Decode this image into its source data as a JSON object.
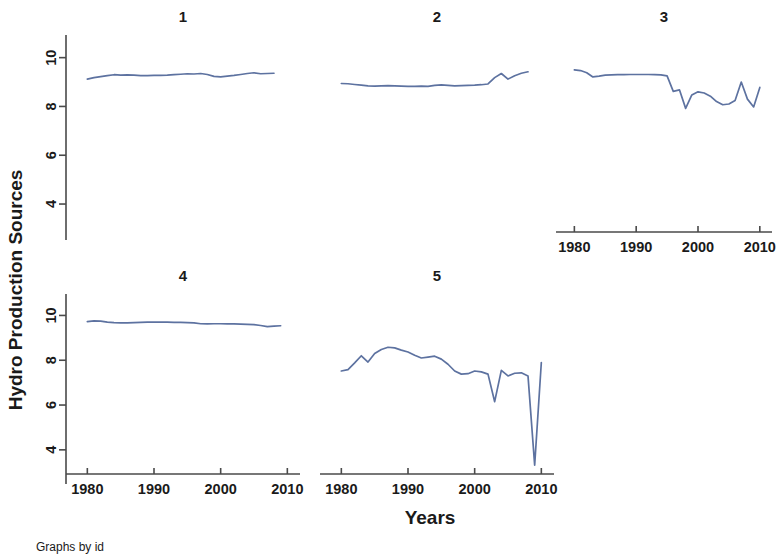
{
  "chart_data": {
    "type": "line",
    "title": "",
    "xlabel": "Years",
    "ylabel": "Hydro Production Sources",
    "note": "Graphs by id",
    "grid": false,
    "legend": "none",
    "line_color": "#5d72a0",
    "axis_color": "#4a4a4a",
    "xlim": [
      1978,
      2011
    ],
    "ylim": [
      3.1,
      10.6
    ],
    "yticks": [
      4,
      6,
      8,
      10
    ],
    "ytick_labels": [
      "4",
      "6",
      "8",
      "10"
    ],
    "xticks": [
      1980,
      1990,
      2000,
      2010
    ],
    "xtick_labels": [
      "1980",
      "1990",
      "2000",
      "2010"
    ],
    "layout": {
      "rows": 2,
      "cols": 3,
      "panel_var": "id"
    },
    "panels": [
      {
        "id": "1",
        "title": "1",
        "row": 0,
        "col": 0,
        "x_axis_visible": false,
        "y_axis_visible": true,
        "x": [
          1980,
          1981,
          1982,
          1983,
          1984,
          1985,
          1986,
          1987,
          1988,
          1989,
          1990,
          1991,
          1992,
          1993,
          1994,
          1995,
          1996,
          1997,
          1998,
          1999,
          2000,
          2001,
          2002,
          2003,
          2004,
          2005,
          2006,
          2007,
          2008
        ],
        "y": [
          9.12,
          9.18,
          9.22,
          9.26,
          9.3,
          9.28,
          9.29,
          9.28,
          9.26,
          9.26,
          9.27,
          9.27,
          9.28,
          9.3,
          9.32,
          9.34,
          9.33,
          9.35,
          9.31,
          9.23,
          9.21,
          9.24,
          9.27,
          9.31,
          9.35,
          9.38,
          9.34,
          9.35,
          9.36
        ]
      },
      {
        "id": "2",
        "title": "2",
        "row": 0,
        "col": 1,
        "x_axis_visible": false,
        "y_axis_visible": false,
        "x": [
          1980,
          1981,
          1982,
          1983,
          1984,
          1985,
          1986,
          1987,
          1988,
          1989,
          1990,
          1991,
          1992,
          1993,
          1994,
          1995,
          1996,
          1997,
          1998,
          1999,
          2000,
          2001,
          2002,
          2003,
          2004,
          2005,
          2006,
          2007,
          2008
        ],
        "y": [
          8.94,
          8.93,
          8.9,
          8.87,
          8.84,
          8.83,
          8.84,
          8.85,
          8.84,
          8.83,
          8.82,
          8.82,
          8.83,
          8.82,
          8.86,
          8.88,
          8.86,
          8.84,
          8.85,
          8.86,
          8.87,
          8.89,
          8.92,
          9.18,
          9.35,
          9.12,
          9.26,
          9.36,
          9.42
        ]
      },
      {
        "id": "3",
        "title": "3",
        "row": 0,
        "col": 2,
        "x_axis_visible": true,
        "y_axis_visible": false,
        "x": [
          1980,
          1981,
          1982,
          1983,
          1984,
          1985,
          1986,
          1987,
          1988,
          1989,
          1990,
          1991,
          1992,
          1993,
          1994,
          1995,
          1996,
          1997,
          1998,
          1999,
          2000,
          2001,
          2002,
          2003,
          2004,
          2005,
          2006,
          2007,
          2008,
          2009,
          2010
        ],
        "y": [
          9.5,
          9.47,
          9.38,
          9.21,
          9.24,
          9.28,
          9.29,
          9.3,
          9.3,
          9.31,
          9.31,
          9.31,
          9.31,
          9.3,
          9.29,
          9.25,
          8.62,
          8.68,
          7.92,
          8.47,
          8.6,
          8.55,
          8.42,
          8.2,
          8.07,
          8.1,
          8.24,
          9.0,
          8.3,
          7.98,
          8.78
        ]
      },
      {
        "id": "4",
        "title": "4",
        "row": 1,
        "col": 0,
        "x_axis_visible": true,
        "y_axis_visible": true,
        "x": [
          1980,
          1981,
          1982,
          1983,
          1984,
          1985,
          1986,
          1987,
          1988,
          1989,
          1990,
          1991,
          1992,
          1993,
          1994,
          1995,
          1996,
          1997,
          1998,
          1999,
          2000,
          2001,
          2002,
          2003,
          2004,
          2005,
          2006,
          2007,
          2008,
          2009
        ],
        "y": [
          9.72,
          9.76,
          9.75,
          9.7,
          9.68,
          9.67,
          9.67,
          9.68,
          9.69,
          9.7,
          9.7,
          9.7,
          9.7,
          9.69,
          9.69,
          9.68,
          9.67,
          9.63,
          9.62,
          9.63,
          9.63,
          9.62,
          9.62,
          9.61,
          9.6,
          9.59,
          9.55,
          9.5,
          9.52,
          9.54
        ]
      },
      {
        "id": "5",
        "title": "5",
        "row": 1,
        "col": 1,
        "x_axis_visible": true,
        "y_axis_visible": false,
        "x": [
          1980,
          1981,
          1982,
          1983,
          1984,
          1985,
          1986,
          1987,
          1988,
          1989,
          1990,
          1991,
          1992,
          1993,
          1994,
          1995,
          1996,
          1997,
          1998,
          1999,
          2000,
          2001,
          2002,
          2003,
          2004,
          2005,
          2006,
          2007,
          2008,
          2009,
          2010
        ],
        "y": [
          7.52,
          7.58,
          7.88,
          8.2,
          7.92,
          8.3,
          8.48,
          8.58,
          8.55,
          8.45,
          8.37,
          8.22,
          8.1,
          8.14,
          8.18,
          8.05,
          7.82,
          7.52,
          7.38,
          7.4,
          7.52,
          7.48,
          7.38,
          6.15,
          7.55,
          7.3,
          7.42,
          7.44,
          7.3,
          3.32,
          7.9
        ]
      }
    ]
  }
}
